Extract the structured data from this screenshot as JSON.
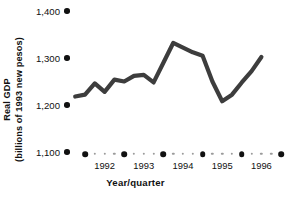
{
  "chart_data": {
    "type": "line",
    "title": "",
    "xlabel": "Year/quarter",
    "ylabel_line1": "Real GDP",
    "ylabel_line2": "(billions of 1993 new pesos)",
    "ylabel": "Real GDP (billions of 1993 new pesos)",
    "ylim": [
      1100,
      1400
    ],
    "yticks": [
      1400,
      1300,
      1200,
      1100
    ],
    "ytick_labels": [
      "1,400",
      "1,300",
      "1,200",
      "1,100"
    ],
    "xlim": [
      1991.75,
      1996.75
    ],
    "xticks": [
      1992,
      1993,
      1994,
      1995,
      1996
    ],
    "xtick_labels": [
      "1992",
      "1993",
      "1994",
      "1995",
      "1996"
    ],
    "minor_ticks_per_interval": 3,
    "grid": false,
    "legend": null,
    "line_color": "#3d3d3d",
    "line_width_px": 4.2,
    "markers": false,
    "x": [
      1991.75,
      1992.0,
      1992.25,
      1992.5,
      1992.75,
      1993.0,
      1993.25,
      1993.5,
      1993.75,
      1994.0,
      1994.25,
      1994.5,
      1994.75,
      1995.0,
      1995.25,
      1995.5,
      1995.75,
      1996.0,
      1996.25,
      1996.5
    ],
    "x_quarter_labels": [
      "1991 Q4",
      "1992 Q1",
      "1992 Q2",
      "1992 Q3",
      "1992 Q4",
      "1993 Q1",
      "1993 Q2",
      "1993 Q3",
      "1993 Q4",
      "1994 Q1",
      "1994 Q2",
      "1994 Q3",
      "1994 Q4",
      "1995 Q1",
      "1995 Q2",
      "1995 Q3",
      "1995 Q4",
      "1996 Q1",
      "1996 Q2",
      "1996 Q3"
    ],
    "values": [
      1218,
      1222,
      1246,
      1228,
      1254,
      1250,
      1262,
      1264,
      1248,
      1290,
      1332,
      1322,
      1312,
      1305,
      1250,
      1208,
      1222,
      1248,
      1272,
      1302
    ],
    "series": [
      {
        "name": "Real GDP",
        "values": [
          1218,
          1222,
          1246,
          1228,
          1254,
          1250,
          1262,
          1264,
          1248,
          1290,
          1332,
          1322,
          1312,
          1305,
          1250,
          1208,
          1222,
          1248,
          1272,
          1302
        ]
      }
    ]
  },
  "axis": {
    "y_dot_color": "#111111",
    "x_major_dot_color": "#111111",
    "x_minor_dot_color": "#9b9b9b"
  }
}
